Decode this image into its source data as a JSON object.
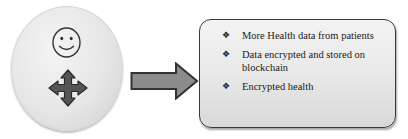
{
  "diagram": {
    "source_node": {
      "shape": "circle",
      "icons": [
        "smiley-face-icon",
        "four-way-move-arrow-icon"
      ],
      "fill": "#e6e6e6"
    },
    "connector": {
      "type": "block-arrow",
      "direction": "right",
      "fill": "#8c8c8c",
      "stroke": "#333333"
    },
    "target_node": {
      "shape": "rounded-rectangle",
      "fill": "#e8e8e8",
      "stroke": "#3a3a3a",
      "bullet_icon": "❖",
      "items": [
        {
          "text": "More Health data from patients"
        },
        {
          "text": "Data encrypted and stored on blockchain"
        },
        {
          "text": "Encrypted health"
        }
      ]
    }
  }
}
